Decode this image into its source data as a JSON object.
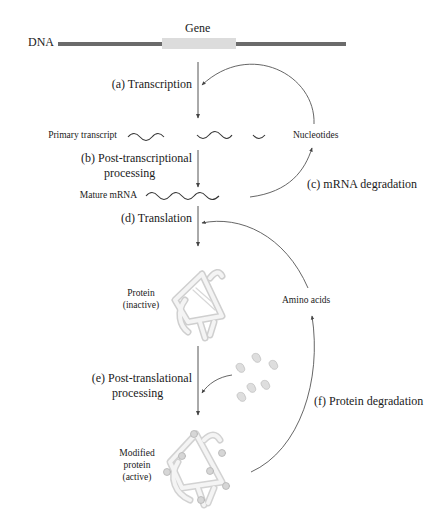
{
  "figure": {
    "dna_label": "DNA",
    "gene_label": "Gene",
    "steps": {
      "a": "(a) Transcription",
      "b_line1": "(b) Post-transcriptional",
      "b_line2": "processing",
      "c": "(c) mRNA degradation",
      "d": "(d) Translation",
      "e_line1": "(e) Post-translational",
      "e_line2": "processing",
      "f": "(f) Protein degradation"
    },
    "molecules": {
      "primary_transcript": "Primary transcript",
      "mature_mrna": "Mature mRNA",
      "nucleotides": "Nucleotides",
      "protein_inactive_line1": "Protein",
      "protein_inactive_line2": "(inactive)",
      "amino_acids": "Amino acids",
      "modified_line1": "Modified",
      "modified_line2": "protein",
      "modified_line3": "(active)"
    },
    "colors": {
      "dna_bar": "#6b6b6b",
      "gene_box": "#dcdcdc",
      "arrow": "#555555",
      "protein": "#e4e4e4"
    }
  }
}
